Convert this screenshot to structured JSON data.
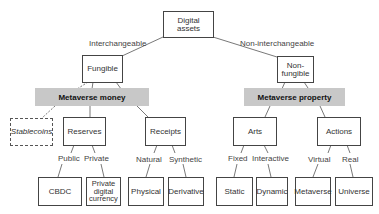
{
  "root": {
    "label": "Digital\nassets"
  },
  "branches": {
    "left": {
      "edge_label": "Interchangeable",
      "node": "Fungible",
      "category": "Metaverse money"
    },
    "right": {
      "edge_label": "Non-interchangeable",
      "node": "Non-\nfungible",
      "category": "Metaverse property"
    }
  },
  "money": {
    "stablecoins": "Stablecoins",
    "reserves": {
      "label": "Reserves",
      "edges": [
        "Public",
        "Private"
      ],
      "children": [
        "CBDC",
        "Private\ndigital\ncurrency"
      ]
    },
    "receipts": {
      "label": "Receipts",
      "edges": [
        "Natural",
        "Synthetic"
      ],
      "children": [
        "Physical",
        "Derivative"
      ]
    }
  },
  "property": {
    "arts": {
      "label": "Arts",
      "edges": [
        "Fixed",
        "Interactive"
      ],
      "children": [
        "Static",
        "Dynamic"
      ]
    },
    "actions": {
      "label": "Actions",
      "edges": [
        "Virtual",
        "Real"
      ],
      "children": [
        "Metaverse",
        "Universe"
      ]
    }
  },
  "colors": {
    "category_bar": "#c8c8c8",
    "border": "#444444",
    "line": "#555555"
  }
}
